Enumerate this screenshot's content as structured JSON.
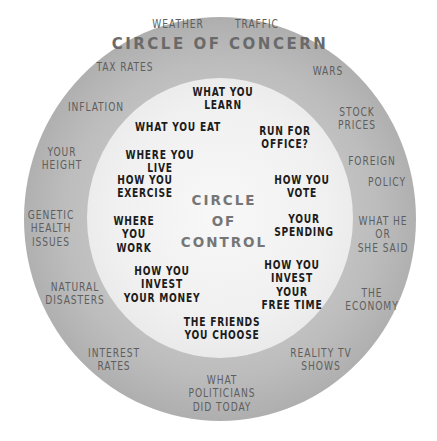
{
  "diagram": {
    "outer_title": "CIRCLE OF CONCERN",
    "inner_title": "CIRCLE\nOF\nCONTROL",
    "colors": {
      "outer_ring": "#b0b0b0",
      "inner_circle": "#f0f0f0",
      "concern_text": "#5e5e5e",
      "control_text": "#1c1c1c",
      "title_text": "#6a6a6a"
    },
    "circle_of_concern": [
      "WEATHER",
      "TRAFFIC",
      "TAX RATES",
      "WARS",
      "INFLATION",
      "STOCK\nPRICES",
      "YOUR\nHEIGHT",
      "FOREIGN",
      "POLICY",
      "GENETIC\nHEALTH\nISSUES",
      "WHAT HE\nOR\nSHE SAID",
      "NATURAL\nDISASTERS",
      "THE\nECONOMY",
      "INTEREST\nRATES",
      "REALITY TV\nSHOWS",
      "WHAT\nPOLITICIANS\nDID TODAY"
    ],
    "circle_of_control": [
      "WHAT YOU\nLEARN",
      "WHAT YOU EAT",
      "RUN FOR\nOFFICE?",
      "WHERE YOU LIVE",
      "HOW YOU\nEXERCISE",
      "HOW YOU\nVOTE",
      "WHERE YOU\nWORK",
      "YOUR\nSPENDING",
      "HOW YOU INVEST\nYOUR MONEY",
      "HOW YOU\nINVEST YOUR\nFREE TIME",
      "THE FRIENDS\nYOU CHOOSE"
    ]
  }
}
